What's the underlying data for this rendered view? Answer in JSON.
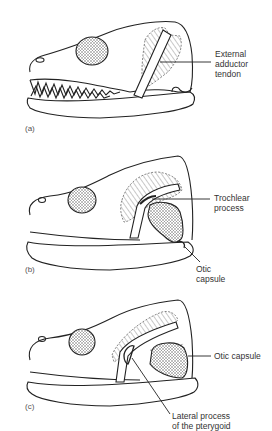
{
  "figure": {
    "panels": [
      {
        "id": "a",
        "label": "(a)",
        "annotations": [
          {
            "line1": "External",
            "line2": "adductor",
            "line3": "tendon"
          }
        ]
      },
      {
        "id": "b",
        "label": "(b)",
        "annotations": [
          {
            "line1": "Trochlear",
            "line2": "process"
          },
          {
            "line1": "Otic",
            "line2": "capsule"
          }
        ]
      },
      {
        "id": "c",
        "label": "(c)",
        "annotations": [
          {
            "line1": "Otic capsule"
          },
          {
            "line1": "Lateral process",
            "line2": "of the pterygoid"
          }
        ]
      }
    ]
  }
}
